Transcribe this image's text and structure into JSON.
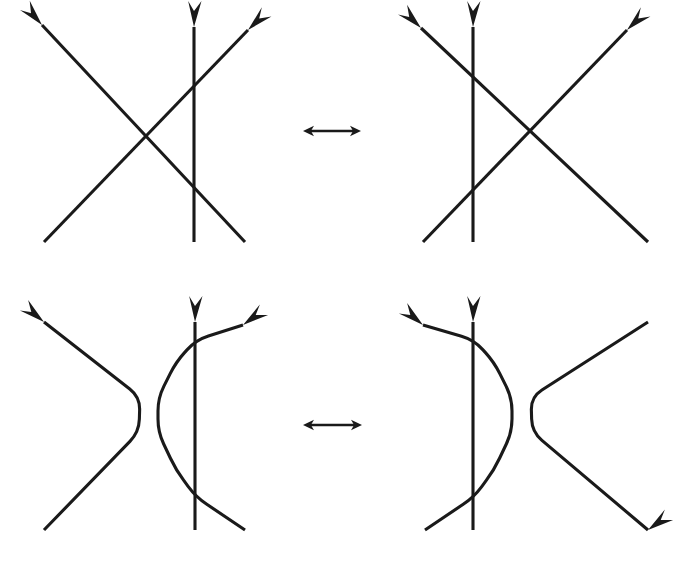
{
  "figure": {
    "background_color": "#ffffff",
    "stroke_color": "#1a1a1a",
    "stroke_width": 3.1,
    "width": 674,
    "height": 564,
    "relation_symbol": "⟷",
    "rows": [
      {
        "id": "row-top",
        "label": "crossing-configuration-equivalence",
        "left_panel": {
          "id": "panel-top-left",
          "label": "three-strand-crossing-vertical-right",
          "strands": [
            {
              "id": "top-left-strand-descending",
              "role": "descending-diagonal",
              "points": [
                [
                  245,
                  242
                ],
                [
                  42,
                  25
                ]
              ],
              "arrow_at": "end",
              "arrow_angle_deg": 227
            },
            {
              "id": "top-left-strand-ascending",
              "role": "ascending-diagonal",
              "points": [
                [
                  44,
                  242
                ],
                [
                  248,
                  30
                ]
              ],
              "arrow_at": "end",
              "arrow_angle_deg": 314
            },
            {
              "id": "top-left-strand-vertical",
              "role": "vertical",
              "points": [
                [
                  194,
                  242
                ],
                [
                  194,
                  27
                ]
              ],
              "arrow_at": "end",
              "arrow_angle_deg": 270
            }
          ]
        },
        "right_panel": {
          "id": "panel-top-right",
          "label": "three-strand-crossing-vertical-left",
          "strands": [
            {
              "id": "top-right-strand-descending",
              "role": "descending-diagonal",
              "points": [
                [
                  648,
                  242
                ],
                [
                  421,
                  28
                ]
              ],
              "arrow_at": "end",
              "arrow_angle_deg": 223
            },
            {
              "id": "top-right-strand-ascending",
              "role": "ascending-diagonal",
              "points": [
                [
                  423,
                  242
                ],
                [
                  627,
                  30
                ]
              ],
              "arrow_at": "end",
              "arrow_angle_deg": 314
            },
            {
              "id": "top-right-strand-vertical",
              "role": "vertical",
              "points": [
                [
                  473,
                  242
                ],
                [
                  473,
                  27
                ]
              ],
              "arrow_at": "end",
              "arrow_angle_deg": 270
            }
          ]
        },
        "relation_arrow": {
          "id": "relation-arrow-top",
          "x1": 303,
          "x2": 361,
          "y": 131,
          "double_headed": true
        }
      },
      {
        "id": "row-bottom",
        "label": "resolved-strand-equivalence",
        "left_panel": {
          "id": "panel-bottom-left",
          "label": "resolved-strands-cusp-left",
          "strands": [
            {
              "id": "bottom-left-strand-cusp",
              "role": "cusp-pointing-right",
              "points": [
                [
                  44,
                  530
                ],
                [
                  139,
                  432
                ],
                [
                  140,
                  397
                ],
                [
                  44,
                  322
                ]
              ],
              "arrow_at": "end",
              "arrow_angle_deg": 218
            },
            {
              "id": "bottom-left-strand-hook",
              "role": "hook-pointing-left",
              "points": [
                [
                  245,
                  530
                ],
                [
                  196,
                  497
                ],
                [
                  176,
                  470
                ],
                [
                  158,
                  432
                ],
                [
                  158,
                  398
                ],
                [
                  176,
                  362
                ],
                [
                  196,
                  340
                ],
                [
                  243,
                  325
                ]
              ],
              "arrow_at": "end",
              "arrow_angle_deg": 322
            },
            {
              "id": "bottom-left-strand-vertical",
              "role": "vertical",
              "points": [
                [
                  195,
                  530
                ],
                [
                  195,
                  322
                ]
              ],
              "arrow_at": "end",
              "arrow_angle_deg": 270
            }
          ]
        },
        "right_panel": {
          "id": "panel-bottom-right",
          "label": "resolved-strands-cusp-right",
          "strands": [
            {
              "id": "bottom-right-strand-cusp",
              "role": "cusp-pointing-left",
              "points": [
                [
                  648,
                  530
                ],
                [
                  532,
                  432
                ],
                [
                  531,
                  397
                ],
                [
                  648,
                  322
                ]
              ],
              "arrow_at": "start",
              "arrow_angle_deg": 322
            },
            {
              "id": "bottom-right-strand-hook",
              "role": "hook-pointing-right",
              "points": [
                [
                  425,
                  530
                ],
                [
                  474,
                  497
                ],
                [
                  494,
                  470
                ],
                [
                  512,
                  432
                ],
                [
                  512,
                  398
                ],
                [
                  494,
                  362
                ],
                [
                  474,
                  340
                ],
                [
                  423,
                  325
                ]
              ],
              "arrow_at": "end",
              "arrow_angle_deg": 218
            },
            {
              "id": "bottom-right-strand-vertical",
              "role": "vertical",
              "points": [
                [
                  473,
                  530
                ],
                [
                  473,
                  322
                ]
              ],
              "arrow_at": "end",
              "arrow_angle_deg": 270
            }
          ]
        },
        "relation_arrow": {
          "id": "relation-arrow-bottom",
          "x1": 303,
          "x2": 362,
          "y": 425,
          "double_headed": true
        }
      }
    ]
  }
}
